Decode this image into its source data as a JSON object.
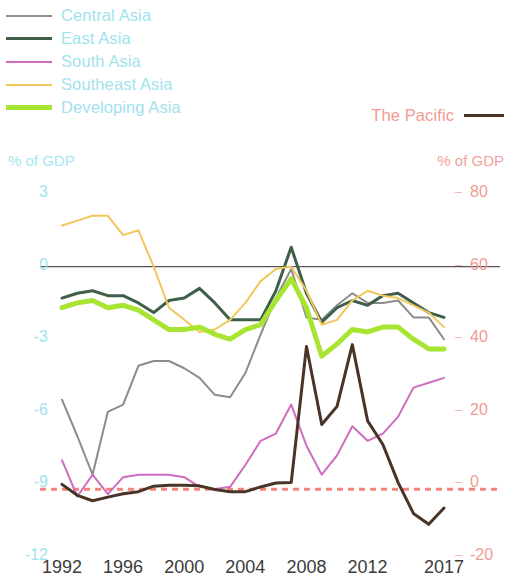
{
  "legend": {
    "left_items": [
      {
        "label": "Central Asia",
        "color": "#8c8c8c",
        "width": 2
      },
      {
        "label": "East Asia",
        "color": "#3f5f4a",
        "width": 3
      },
      {
        "label": "South Asia",
        "color": "#cf6cc0",
        "width": 2
      },
      {
        "label": "Southeast Asia",
        "color": "#f2c75a",
        "width": 2
      },
      {
        "label": "Developing Asia",
        "color": "#a8e533",
        "width": 5
      }
    ],
    "right_item": {
      "label": "The Pacific",
      "color": "#4a3327",
      "width": 3
    }
  },
  "axes": {
    "left_caption": "% of GDP",
    "right_caption": "% of GDP",
    "left_caption_color": "#a5e8f0",
    "right_caption_color": "#f2a29a",
    "left_ticks": [
      "3",
      "0",
      "-3",
      "-6",
      "-9",
      "-12"
    ],
    "right_ticks": [
      "80",
      "60",
      "40",
      "20",
      "0",
      "-20"
    ],
    "x_ticks": [
      "1992",
      "1996",
      "2000",
      "2004",
      "2008",
      "2012",
      "2017"
    ]
  },
  "chart_data": {
    "type": "line",
    "title": "",
    "subtitle": "",
    "xlabel": "",
    "ylabel": "% of GDP",
    "ylabel_right": "% of GDP",
    "grid": false,
    "legend_position": "top-left",
    "x": [
      1992,
      1993,
      1994,
      1995,
      1996,
      1997,
      1998,
      1999,
      2000,
      2001,
      2002,
      2003,
      2004,
      2005,
      2006,
      2007,
      2008,
      2009,
      2010,
      2011,
      2012,
      2013,
      2014,
      2015,
      2016,
      2017
    ],
    "xlim": [
      1992,
      2017
    ],
    "ylim_left": [
      -12,
      3
    ],
    "ylim_right": [
      -20,
      80
    ],
    "left_ticks_values": [
      3,
      0,
      -3,
      -6,
      -9,
      -12
    ],
    "right_ticks_values": [
      80,
      60,
      40,
      20,
      0,
      -20
    ],
    "zero_line": 0,
    "reference_line": {
      "label": "",
      "value_left": -9.2,
      "value_right": 0,
      "color": "#f4837a",
      "style": "dashed"
    },
    "series": [
      {
        "name": "Central Asia",
        "axis": "left",
        "color": "#8c8c8c",
        "width": 2,
        "values": [
          -5.5,
          -7.0,
          -8.6,
          -6.0,
          -5.7,
          -4.1,
          -3.9,
          -3.9,
          -4.2,
          -4.6,
          -5.3,
          -5.4,
          -4.4,
          -2.8,
          -1.3,
          -0.1,
          -2.1,
          -2.2,
          -1.6,
          -1.1,
          -1.5,
          -1.5,
          -1.4,
          -2.1,
          -2.1,
          -3.0
        ]
      },
      {
        "name": "East Asia",
        "axis": "left",
        "color": "#3f5f4a",
        "width": 3,
        "values": [
          -1.3,
          -1.1,
          -1.0,
          -1.2,
          -1.2,
          -1.5,
          -1.9,
          -1.4,
          -1.3,
          -0.9,
          -1.5,
          -2.2,
          -2.2,
          -2.2,
          -1.0,
          0.8,
          -1.1,
          -2.3,
          -1.7,
          -1.4,
          -1.6,
          -1.2,
          -1.1,
          -1.5,
          -1.9,
          -2.1
        ]
      },
      {
        "name": "South Asia",
        "axis": "left",
        "color": "#cf6cc0",
        "width": 2,
        "values": [
          -8.0,
          -9.5,
          -8.6,
          -9.4,
          -8.7,
          -8.6,
          -8.6,
          -8.6,
          -8.7,
          -9.1,
          -9.2,
          -9.1,
          -8.2,
          -7.2,
          -6.9,
          -5.7,
          -7.4,
          -8.6,
          -7.8,
          -6.6,
          -7.2,
          -6.9,
          -6.2,
          -5.0,
          -4.8,
          -4.6
        ]
      },
      {
        "name": "Southeast Asia",
        "axis": "left",
        "color": "#f2c75a",
        "width": 2,
        "values": [
          1.7,
          1.9,
          2.1,
          2.1,
          1.3,
          1.5,
          0.0,
          -1.7,
          -2.2,
          -2.7,
          -2.6,
          -2.2,
          -1.5,
          -0.6,
          -0.1,
          0.0,
          -1.0,
          -2.4,
          -2.2,
          -1.4,
          -1.0,
          -1.2,
          -1.3,
          -1.6,
          -1.9,
          -2.5
        ]
      },
      {
        "name": "Developing Asia",
        "axis": "left",
        "color": "#a8e533",
        "width": 5,
        "values": [
          -1.7,
          -1.5,
          -1.4,
          -1.7,
          -1.6,
          -1.8,
          -2.2,
          -2.6,
          -2.6,
          -2.5,
          -2.8,
          -3.0,
          -2.6,
          -2.4,
          -1.4,
          -0.5,
          -1.7,
          -3.7,
          -3.2,
          -2.6,
          -2.7,
          -2.5,
          -2.5,
          -3.0,
          -3.4,
          -3.4
        ]
      },
      {
        "name": "The Pacific",
        "axis": "right",
        "color": "#4a3327",
        "width": 3,
        "values": [
          0.0,
          -3.0,
          -4.5,
          -3.5,
          -2.6,
          -2.0,
          -0.5,
          -0.2,
          -0.2,
          -0.4,
          -1.4,
          -2.0,
          -2.0,
          -0.7,
          0.4,
          0.5,
          38.0,
          16.5,
          21.5,
          38.5,
          17.5,
          11.0,
          0.5,
          -8.0,
          -11.0,
          -6.5
        ]
      }
    ]
  }
}
